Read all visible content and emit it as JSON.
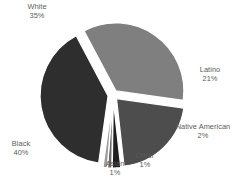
{
  "chart_data": {
    "type": "pie",
    "title": "",
    "subtitle": "",
    "xlabel": "",
    "ylabel": "",
    "legend_position": "none",
    "grid": false,
    "exploded": true,
    "value_suffix": "%",
    "categories": [
      "White",
      "Latino",
      "Native American",
      "Other",
      "Asian",
      "Black"
    ],
    "values": [
      35,
      21,
      2,
      1,
      1,
      40
    ],
    "slices": [
      {
        "label": "White",
        "value": 35,
        "value_text": "35%",
        "color": "#7f7f7f"
      },
      {
        "label": "Latino",
        "value": 21,
        "value_text": "21%",
        "color": "#4d4d4d"
      },
      {
        "label": "Native American",
        "value": 2,
        "value_text": "2%",
        "color": "#1f1f1f"
      },
      {
        "label": "Other",
        "value": 1,
        "value_text": "1%",
        "color": "#6b6b6b"
      },
      {
        "label": "Asian",
        "value": 1,
        "value_text": "1%",
        "color": "#9a9a9a"
      },
      {
        "label": "Black",
        "value": 40,
        "value_text": "40%",
        "color": "#2e2e2e"
      }
    ]
  },
  "labels": {
    "white": {
      "name": "White",
      "value": "35%"
    },
    "latino": {
      "name": "Latino",
      "value": "21%"
    },
    "native": {
      "name": "Native American",
      "value": "2%"
    },
    "other": {
      "name": "Other",
      "value": "1%"
    },
    "asian": {
      "name": "Asian",
      "value": "1%"
    },
    "black": {
      "name": "Black",
      "value": "40%"
    }
  },
  "colors": {
    "background": "#ffffff",
    "text": "#5a5a5a",
    "white_slice": "#7f7f7f",
    "latino_slice": "#4d4d4d",
    "native_slice": "#1f1f1f",
    "other_slice": "#6b6b6b",
    "asian_slice": "#9a9a9a",
    "black_slice": "#2e2e2e"
  }
}
